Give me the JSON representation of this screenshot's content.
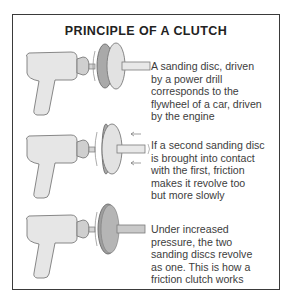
{
  "title": "PRINCIPLE OF A CLUTCH",
  "panels": [
    {
      "illustration": "drill-with-two-separated-sanding-discs",
      "caption": "A sanding disc, driven\nby a power drill\ncorresponds to the\nflywheel of a car, driven\nby the engine"
    },
    {
      "illustration": "drill-with-second-disc-pressed-into-contact",
      "caption": "If a second sanding disc\nis brought into contact\nwith the first, friction\nmakes it revolve too\nbut more slowly"
    },
    {
      "illustration": "drill-with-discs-revolving-as-one",
      "caption": "Under increased\npressure, the two\nsanding discs revolve\nas one. This is how a\nfriction clutch works"
    }
  ],
  "colors": {
    "border": "#3a3a3a",
    "drill_body": "#e6e6e6",
    "drill_outline": "#7a7a7a",
    "disc_dark": "#a9a9a9",
    "disc_light": "#e2e2e2",
    "text": "#3d3d3d"
  }
}
